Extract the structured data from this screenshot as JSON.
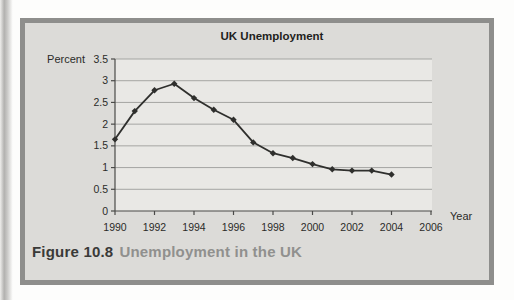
{
  "figure_box": {
    "fill": "#dcdbd8",
    "border_color": "#8e8e8c"
  },
  "chart_data": {
    "type": "line",
    "title": "UK Unemployment",
    "ylabel": "Percent",
    "xlabel": "Year",
    "x": [
      1990,
      1991,
      1992,
      1993,
      1994,
      1995,
      1996,
      1997,
      1998,
      1999,
      2000,
      2001,
      2002,
      2003,
      2004
    ],
    "values": [
      1.65,
      2.3,
      2.78,
      2.93,
      2.6,
      2.33,
      2.1,
      1.58,
      1.33,
      1.22,
      1.08,
      0.96,
      0.93,
      0.93,
      0.84
    ],
    "xlim": [
      1990,
      2006
    ],
    "ylim": [
      0,
      3.5
    ],
    "xticks": [
      1990,
      1992,
      1994,
      1996,
      1998,
      2000,
      2002,
      2004,
      2006
    ],
    "yticks": [
      0,
      0.5,
      1,
      1.5,
      2,
      2.5,
      3,
      3.5
    ],
    "grid": "horizontal",
    "legend": "none",
    "marker": "diamond",
    "line_color": "#2f2f2d",
    "marker_color": "#2f2f2d",
    "plot_bg": "#e9e8e5",
    "grid_color": "#a5a5a3",
    "axis_color": "#4a4a48",
    "text_color": "#2b2b29"
  },
  "caption": {
    "label": "Figure 10.8",
    "title": "Unemployment in the UK",
    "title_color": "#90908e"
  }
}
